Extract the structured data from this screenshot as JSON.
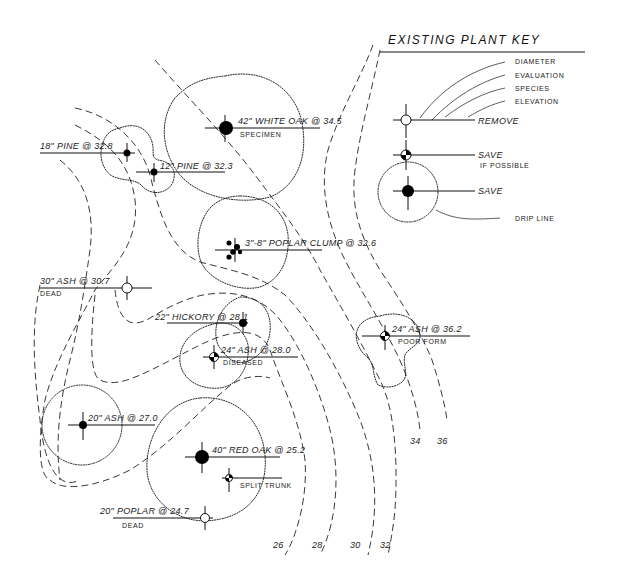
{
  "key": {
    "title": "EXISTING PLANT KEY",
    "label_parts": [
      "DIAMETER",
      "EVALUATION",
      "SPECIES",
      "ELEVATION"
    ],
    "symbols": [
      {
        "label": "REMOVE",
        "sublabel": ""
      },
      {
        "label": "SAVE",
        "sublabel": "IF POSSIBLE"
      },
      {
        "label": "SAVE",
        "sublabel": ""
      }
    ],
    "drip_line_label": "DRIP LINE"
  },
  "trees": [
    {
      "id": "white-oak",
      "label": "42\" WHITE OAK @ 34.5",
      "note": "SPECIMEN",
      "status": "save"
    },
    {
      "id": "pine-18",
      "label": "18\" PINE @ 32.8",
      "note": "",
      "status": "save"
    },
    {
      "id": "pine-12",
      "label": "12\" PINE @ 32.3",
      "note": "",
      "status": "save"
    },
    {
      "id": "poplar-clump",
      "label": "3\"-8\" POPLAR CLUMP @ 32.6",
      "note": "",
      "status": "save"
    },
    {
      "id": "ash-30",
      "label": "30\" ASH @ 30.7",
      "note": "DEAD",
      "status": "remove"
    },
    {
      "id": "hickory",
      "label": "22\" HICKORY @ 28.1",
      "note": "",
      "status": "save"
    },
    {
      "id": "ash-24-diseased",
      "label": "24\" ASH @ 28.0",
      "note": "DISEASED",
      "status": "save-if-possible"
    },
    {
      "id": "ash-24-poor",
      "label": "24\" ASH @ 36.2",
      "note": "POOR FORM",
      "status": "save-if-possible"
    },
    {
      "id": "ash-20",
      "label": "20\" ASH @ 27.0",
      "note": "",
      "status": "save"
    },
    {
      "id": "red-oak",
      "label": "40\" RED OAK @ 25.2",
      "note": "",
      "status": "save"
    },
    {
      "id": "split-trunk",
      "label": "SPLIT TRUNK",
      "note": "",
      "status": "save-if-possible"
    },
    {
      "id": "poplar-20",
      "label": "20\" POPLAR @ 24.7",
      "note": "DEAD",
      "status": "remove"
    }
  ],
  "contours": [
    "26",
    "28",
    "30",
    "32",
    "34",
    "36"
  ]
}
